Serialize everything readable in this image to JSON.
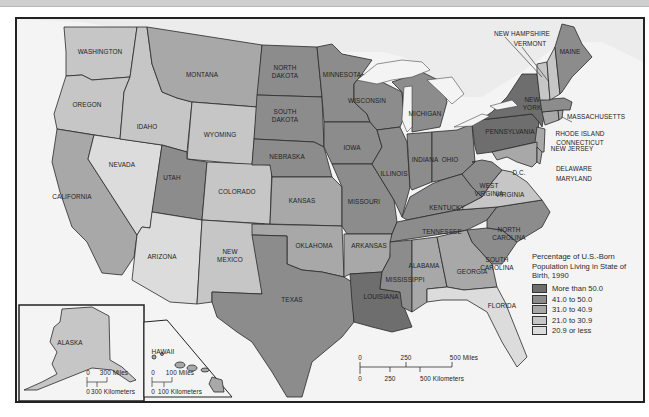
{
  "title": "Percentage of U.S.-Born Population Living in State of Birth, 1990",
  "legend": {
    "title": "Percentage of U.S.-Born Population Living in State of Birth, 1990",
    "items": [
      {
        "label": "More than 50.0",
        "color": "#6e6e6e"
      },
      {
        "label": "41.0 to 50.0",
        "color": "#8c8c8c"
      },
      {
        "label": "31.0 to 40.9",
        "color": "#a8a8a8"
      },
      {
        "label": "21.0 to 30.9",
        "color": "#c6c6c6"
      },
      {
        "label": "20.9 or less",
        "color": "#dcdcdc"
      }
    ]
  },
  "colors": {
    "water": "#f4f4f4",
    "border": "#2a2a2a",
    "frame": "#222222"
  },
  "states": {
    "washington": "WASHINGTON",
    "oregon": "OREGON",
    "california": "CALIFORNIA",
    "nevada": "NEVADA",
    "idaho": "IDAHO",
    "montana": "MONTANA",
    "wyoming": "WYOMING",
    "utah": "UTAH",
    "colorado": "COLORADO",
    "arizona": "ARIZONA",
    "new_mexico": "NEW MEXICO",
    "north_dakota": "NORTH DAKOTA",
    "south_dakota": "SOUTH DAKOTA",
    "nebraska": "NEBRASKA",
    "kansas": "KANSAS",
    "oklahoma": "OKLAHOMA",
    "texas": "TEXAS",
    "minnesota": "MINNESOTA",
    "iowa": "IOWA",
    "missouri": "MISSOURI",
    "arkansas": "ARKANSAS",
    "louisiana": "LOUISIANA",
    "wisconsin": "WISCONSIN",
    "illinois": "ILLINOIS",
    "michigan": "MICHIGAN",
    "indiana": "INDIANA",
    "ohio": "OHIO",
    "kentucky": "KENTUCKY",
    "tennessee": "TENNESSEE",
    "mississippi": "MISSISSIPPI",
    "alabama": "ALABAMA",
    "georgia": "GEORGIA",
    "florida": "FLORIDA",
    "south_carolina": "SOUTH CAROLINA",
    "north_carolina": "NORTH CAROLINA",
    "virginia": "VIRGINIA",
    "west_virginia": "WEST VIRGINIA",
    "pennsylvania": "PENNSYLVANIA",
    "new_york": "NEW YORK",
    "new_jersey": "NEW JERSEY",
    "delaware": "DELAWARE",
    "maryland": "MARYLAND",
    "dc": "D.C.",
    "connecticut": "CONNECTICUT",
    "rhode_island": "RHODE ISLAND",
    "massachusetts": "MASSACHUSETTS",
    "vermont": "VERMONT",
    "new_hampshire": "NEW HAMPSHIRE",
    "maine": "MAINE",
    "alaska": "ALASKA",
    "hawaii": "HAWAII"
  },
  "state_class": {
    "washington": 4,
    "oregon": 4,
    "california": 3,
    "nevada": 5,
    "idaho": 4,
    "montana": 3,
    "wyoming": 4,
    "utah": 2,
    "colorado": 4,
    "arizona": 5,
    "new_mexico": 4,
    "north_dakota": 2,
    "south_dakota": 2,
    "nebraska": 2,
    "kansas": 3,
    "oklahoma": 3,
    "texas": 2,
    "minnesota": 2,
    "iowa": 2,
    "missouri": 2,
    "arkansas": 3,
    "louisiana": 1,
    "wisconsin": 2,
    "illinois": 2,
    "michigan": 2,
    "indiana": 2,
    "ohio": 2,
    "kentucky": 2,
    "tennessee": 2,
    "mississippi": 2,
    "alabama": 3,
    "georgia": 3,
    "florida": 5,
    "south_carolina": 2,
    "north_carolina": 2,
    "virginia": 4,
    "west_virginia": 2,
    "pennsylvania": 1,
    "new_york": 1,
    "new_jersey": 3,
    "delaware": 3,
    "maryland": 3,
    "connecticut": 3,
    "rhode_island": 3,
    "massachusetts": 2,
    "vermont": 4,
    "new_hampshire": 4,
    "maine": 2,
    "alaska": 4,
    "hawaii": 3
  },
  "scale_main": {
    "miles": [
      "0",
      "250",
      "500 Miles"
    ],
    "km": [
      "0",
      "250",
      "500 Kilometers"
    ]
  },
  "scale_alaska": {
    "miles": [
      "0",
      "300 Miles"
    ],
    "km": [
      "0",
      "300 Kilometers"
    ]
  },
  "scale_hawaii": {
    "miles": [
      "0",
      "100 Miles"
    ],
    "km": [
      "0",
      "100 Kilometers"
    ]
  }
}
